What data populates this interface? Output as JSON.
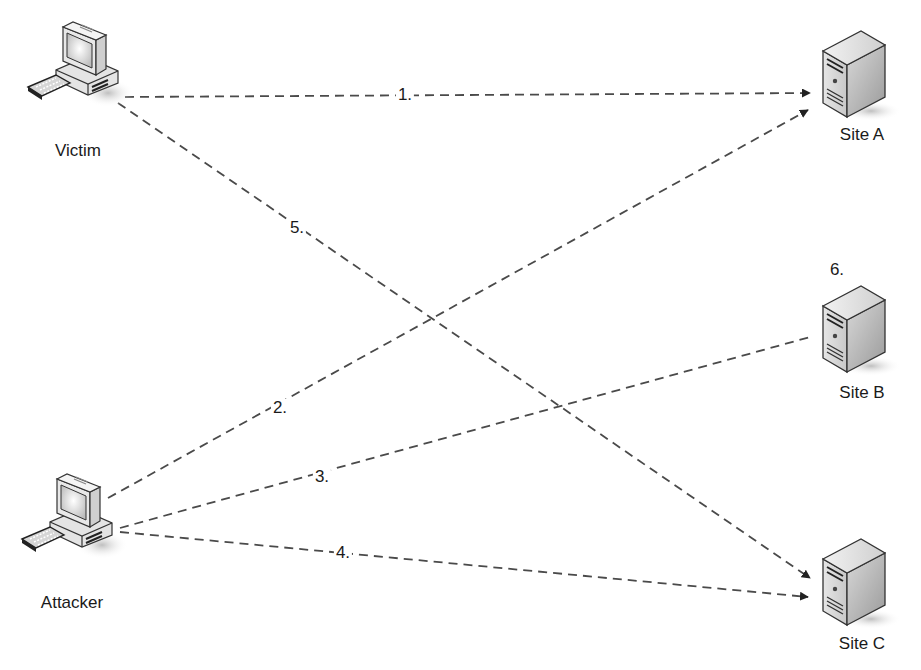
{
  "diagram": {
    "type": "network-attack-flow",
    "colors": {
      "line": "#4a4a4a",
      "text": "#1a1a1a",
      "background": "#ffffff"
    },
    "nodes": [
      {
        "id": "victim",
        "label": "Victim",
        "icon": "desktop-computer-icon",
        "x": 78,
        "y": 75,
        "label_x": 78,
        "label_y": 142
      },
      {
        "id": "attacker",
        "label": "Attacker",
        "icon": "desktop-computer-icon",
        "x": 72,
        "y": 527,
        "label_x": 72,
        "label_y": 594
      },
      {
        "id": "site_a",
        "label": "Site A",
        "icon": "server-tower-icon",
        "x": 857,
        "y": 75,
        "label_x": 862,
        "label_y": 126
      },
      {
        "id": "site_b",
        "label": "Site B",
        "icon": "server-tower-icon",
        "x": 857,
        "y": 330,
        "label_x": 862,
        "label_y": 384
      },
      {
        "id": "site_c",
        "label": "Site C",
        "icon": "server-tower-icon",
        "x": 857,
        "y": 583,
        "label_x": 862,
        "label_y": 635
      }
    ],
    "edges": [
      {
        "id": "step1",
        "label": "1.",
        "from": "victim",
        "to": "site_a",
        "x1": 125,
        "y1": 97,
        "x2": 810,
        "y2": 93,
        "arrow": true,
        "label_x": 405,
        "label_y": 95
      },
      {
        "id": "step2",
        "label": "2.",
        "from": "attacker",
        "to": "site_a",
        "x1": 108,
        "y1": 498,
        "x2": 808,
        "y2": 110,
        "arrow": true,
        "label_x": 280,
        "label_y": 408
      },
      {
        "id": "step3",
        "label": "3.",
        "from": "attacker",
        "to": "site_b",
        "x1": 120,
        "y1": 528,
        "x2": 810,
        "y2": 337,
        "arrow": false,
        "label_x": 322,
        "label_y": 477
      },
      {
        "id": "step4",
        "label": "4.",
        "from": "attacker",
        "to": "site_c",
        "x1": 120,
        "y1": 532,
        "x2": 808,
        "y2": 597,
        "arrow": true,
        "label_x": 343,
        "label_y": 553
      },
      {
        "id": "step5",
        "label": "5.",
        "from": "victim",
        "to": "site_c",
        "x1": 118,
        "y1": 103,
        "x2": 810,
        "y2": 578,
        "arrow": true,
        "label_x": 297,
        "label_y": 228
      }
    ],
    "annotations": [
      {
        "id": "step6",
        "label": "6.",
        "near": "site_b",
        "x": 837,
        "y": 270
      }
    ]
  }
}
